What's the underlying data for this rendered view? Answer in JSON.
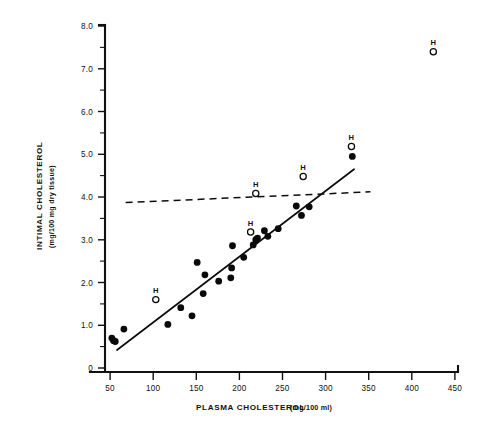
{
  "chart_data": {
    "type": "scatter",
    "title": "",
    "xlabel": "PLASMA CHOLESTEROL",
    "xlabel_units": "(mg/100 ml)",
    "ylabel": "INTIMAL CHOLESTEROL",
    "ylabel_units": "(mg/100 mg dry tissue)",
    "xlim": [
      0,
      450
    ],
    "ylim": [
      0,
      8.0
    ],
    "xticks": [
      50,
      100,
      150,
      200,
      250,
      300,
      350,
      400,
      450
    ],
    "xtick_labels": [
      "50",
      "100",
      "150",
      "200",
      "250",
      "300",
      "350",
      "400",
      "450"
    ],
    "yticks": [
      0,
      1.0,
      2.0,
      3.0,
      4.0,
      5.0,
      6.0,
      7.0,
      8.0
    ],
    "ytick_labels": [
      "0",
      "1.0",
      "2.0",
      "3.0",
      "4.0",
      "5.0",
      "6.0",
      "7.0",
      "8.0"
    ],
    "yticks_minor": [
      0.5,
      1.5,
      2.5,
      3.5,
      4.5,
      5.5,
      6.5,
      7.5
    ],
    "grid": false,
    "legend_position": "none",
    "series": [
      {
        "name": "control",
        "marker": "filled-circle",
        "color": "#0a0a0a",
        "points": [
          [
            52,
            0.7
          ],
          [
            54,
            0.64
          ],
          [
            56,
            0.62
          ],
          [
            66,
            0.91
          ],
          [
            117,
            1.02
          ],
          [
            132,
            1.41
          ],
          [
            145,
            1.22
          ],
          [
            151,
            2.47
          ],
          [
            158,
            1.74
          ],
          [
            160,
            2.18
          ],
          [
            176,
            2.03
          ],
          [
            190,
            2.11
          ],
          [
            191,
            2.34
          ],
          [
            192,
            2.86
          ],
          [
            205,
            2.59
          ],
          [
            216,
            2.88
          ],
          [
            219,
            3.0
          ],
          [
            221,
            3.04
          ],
          [
            229,
            3.21
          ],
          [
            233,
            3.08
          ],
          [
            245,
            3.26
          ],
          [
            266,
            3.79
          ],
          [
            272,
            3.57
          ],
          [
            281,
            3.77
          ],
          [
            331,
            4.95
          ]
        ]
      },
      {
        "name": "hypothyroid",
        "marker": "open-circle",
        "label": "H",
        "color": "#0a0a0a",
        "points": [
          [
            103,
            1.6
          ],
          [
            213,
            3.18
          ],
          [
            219,
            4.08
          ],
          [
            274,
            4.48
          ],
          [
            330,
            5.18
          ],
          [
            425,
            7.4
          ]
        ]
      }
    ],
    "lines": [
      {
        "name": "regression-solid",
        "style": "solid",
        "from": [
          58,
          0.42
        ],
        "to": [
          333,
          4.65
        ]
      },
      {
        "name": "regression-dashed",
        "style": "dashed",
        "from": [
          68,
          3.87
        ],
        "to": [
          352,
          4.12
        ]
      }
    ]
  }
}
